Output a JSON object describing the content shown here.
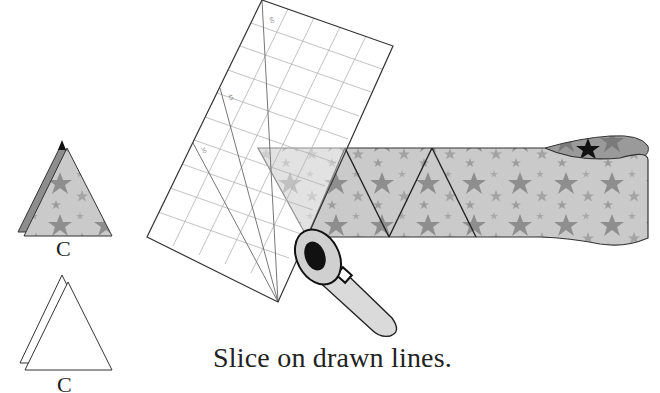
{
  "diagram": {
    "type": "quilting instruction illustration",
    "caption": "Slice on drawn lines.",
    "pieces": [
      {
        "label": "C",
        "style": "star-print fabric triangle, folded pair"
      },
      {
        "label": "C",
        "style": "outline triangle, folded pair"
      }
    ],
    "ruler": {
      "angle_marks": [
        "60",
        "45",
        "30"
      ],
      "grid": true
    },
    "fabric_strip": {
      "pattern": "stars",
      "triangles_marked": 3
    },
    "tool": "rotary-cutter",
    "colors": {
      "fabric_base": "#c8c8c8",
      "star": "#8a8a8a",
      "outline": "#222222",
      "ruler_grid": "#b5b5b5",
      "cutter_handle": "#d9d9d9",
      "cutter_blade_hub": "#111111"
    }
  }
}
